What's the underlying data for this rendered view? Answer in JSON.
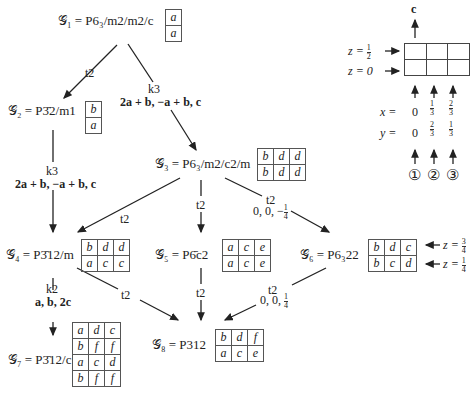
{
  "nodes": {
    "g1": {
      "name": "G1",
      "symbol": "P6_3/m2/m2/c",
      "label": "𝒢₁ = P6₃/m2/m2/c",
      "wyckoff": [
        [
          "a"
        ],
        [
          "a"
        ]
      ]
    },
    "g2": {
      "name": "G2",
      "symbol": "P-32/m1",
      "label": "𝒢₂ = P3̄2/m1",
      "wyckoff": [
        [
          "b"
        ],
        [
          "a"
        ]
      ]
    },
    "g3": {
      "name": "G3",
      "symbol": "P6_3/m2/c2/m",
      "label": "𝒢₃ = P6₃/m2/c2/m",
      "wyckoff": [
        [
          "b",
          "d",
          "d"
        ],
        [
          "b",
          "d",
          "d"
        ]
      ]
    },
    "g4": {
      "name": "G4",
      "symbol": "P-312/m",
      "label": "𝒢₄ = P3̄12/m",
      "wyckoff": [
        [
          "b",
          "d",
          "d"
        ],
        [
          "a",
          "c",
          "c"
        ]
      ]
    },
    "g5": {
      "name": "G5",
      "symbol": "P-6c2",
      "label": "𝒢₅ = P6̄c2",
      "wyckoff": [
        [
          "a",
          "c",
          "e"
        ],
        [
          "a",
          "c",
          "e"
        ]
      ]
    },
    "g6": {
      "name": "G6",
      "symbol": "P6_322",
      "label": "𝒢₆ = P6₃22",
      "wyckoff": [
        [
          "b",
          "d",
          "c"
        ],
        [
          "b",
          "c",
          "d"
        ]
      ]
    },
    "g7": {
      "name": "G7",
      "symbol": "P-312/c",
      "label": "𝒢₇ = P3̄12/c",
      "wyckoff": [
        [
          "a",
          "d",
          "c"
        ],
        [
          "b",
          "f",
          "f"
        ],
        [
          "a",
          "c",
          "d"
        ],
        [
          "b",
          "f",
          "f"
        ]
      ]
    },
    "g8": {
      "name": "G8",
      "symbol": "P312",
      "label": "𝒢₈ = P312",
      "wyckoff": [
        [
          "b",
          "d",
          "f"
        ],
        [
          "a",
          "c",
          "e"
        ]
      ]
    }
  },
  "edges": [
    {
      "from": "g1",
      "to": "g2",
      "type": "t2",
      "transform": ""
    },
    {
      "from": "g1",
      "to": "g3",
      "type": "k3",
      "transform": "2a + b, −a + b, c"
    },
    {
      "from": "g2",
      "to": "g4",
      "type": "k3",
      "transform": "2a + b, −a + b, c"
    },
    {
      "from": "g3",
      "to": "g4",
      "type": "t2",
      "transform": ""
    },
    {
      "from": "g3",
      "to": "g5",
      "type": "t2",
      "transform": ""
    },
    {
      "from": "g3",
      "to": "g6",
      "type": "t2",
      "transform": "0, 0, −1/4"
    },
    {
      "from": "g4",
      "to": "g7",
      "type": "k2",
      "transform": "a, b, 2c"
    },
    {
      "from": "g4",
      "to": "g8",
      "type": "t2",
      "transform": ""
    },
    {
      "from": "g5",
      "to": "g8",
      "type": "t2",
      "transform": ""
    },
    {
      "from": "g6",
      "to": "g8",
      "type": "t2",
      "transform": "0, 0, 1/4"
    }
  ],
  "labels": {
    "t2": "t2",
    "k3": "k3",
    "k2": "k2",
    "k3_transform": "2a + b, −a + b, c",
    "k2_transform": "a, b, 2c",
    "shift_neg": "0, 0, −",
    "shift_pos": "0, 0, ",
    "quarter_num": "1",
    "quarter_den": "4"
  },
  "g6_levels": {
    "upper": "z = ",
    "upper_num": "3",
    "upper_den": "4",
    "lower": "z = ",
    "lower_num": "1",
    "lower_den": "4"
  },
  "legend": {
    "axis_label": "c",
    "z_top": "z = ",
    "z_top_num": "1",
    "z_top_den": "2",
    "z_bottom": "z = 0",
    "x_label": "x =",
    "y_label": "y =",
    "columns": [
      {
        "x": "0",
        "x_num": "",
        "x_den": "",
        "y": "0",
        "marker": "①"
      },
      {
        "x": "",
        "x_num": "1",
        "x_den": "3",
        "y_num": "2",
        "y_den": "3",
        "marker": "②"
      },
      {
        "x": "",
        "x_num": "2",
        "x_den": "3",
        "y_num": "1",
        "y_den": "3",
        "marker": "③"
      }
    ]
  }
}
